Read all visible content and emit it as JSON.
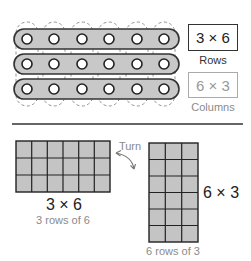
{
  "top": {
    "bars": {
      "rows": 3,
      "holes_per_row": 6,
      "fill": "#c8c8c8",
      "stroke": "#333333"
    },
    "row_box": {
      "text": "3 × 6",
      "label": "Rows"
    },
    "column_box": {
      "text": "6 × 3",
      "label": "Columns"
    }
  },
  "bottom": {
    "left_array": {
      "rows": 3,
      "cols": 6,
      "title": "3 × 6",
      "caption": "3 rows of 6"
    },
    "turn_label": "Turn",
    "right_array": {
      "rows": 6,
      "cols": 3,
      "title": "6 × 3",
      "caption": "6 rows of 3"
    },
    "cell_fill": "#c4c4c4",
    "grid_stroke": "#222222"
  }
}
